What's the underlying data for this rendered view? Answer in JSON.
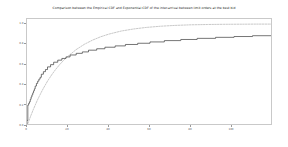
{
  "figure": {
    "background_color": "#ffffff",
    "width": 288,
    "height": 147
  },
  "chart_data": {
    "type": "line",
    "title": "Comparison between the Empirical CDF and Exponential CDF of the inter-arrival between limit orders at the best bid",
    "xlabel": "",
    "ylabel": "",
    "xlim": [
      0,
      120
    ],
    "ylim": [
      0,
      1.05
    ],
    "grid": false,
    "legend_position": "none",
    "xticks": [
      0,
      20,
      40,
      60,
      80,
      100
    ],
    "xtick_labels": [
      "0",
      "20",
      "40",
      "60",
      "80",
      "100"
    ],
    "yticks": [
      0.0,
      0.2,
      0.4,
      0.6,
      0.8,
      1.0
    ],
    "ytick_labels": [
      "0.0",
      "0.2",
      "0.4",
      "0.6",
      "0.8",
      "1.0"
    ],
    "series": [
      {
        "name": "Empirical CDF",
        "style": "step",
        "color": "#3b3b3b",
        "linewidth": 0.7,
        "x": [
          0.0,
          0.4,
          0.8,
          1.2,
          1.6,
          2.0,
          2.4,
          2.8,
          3.2,
          3.6,
          4.0,
          4.6,
          5.2,
          5.8,
          6.4,
          7.0,
          8.0,
          9.0,
          10.0,
          11.5,
          13.0,
          15.0,
          17.0,
          19.0,
          21.0,
          24.0,
          27.0,
          30.0,
          34.0,
          38.0,
          43.0,
          48.0,
          54.0,
          60.0,
          67.0,
          75.0,
          83.0,
          92.0,
          101.0,
          110.0,
          120.0
        ],
        "y": [
          0.0,
          0.055,
          0.205,
          0.222,
          0.238,
          0.262,
          0.285,
          0.305,
          0.325,
          0.345,
          0.365,
          0.392,
          0.418,
          0.44,
          0.46,
          0.478,
          0.508,
          0.533,
          0.554,
          0.58,
          0.602,
          0.626,
          0.646,
          0.663,
          0.678,
          0.697,
          0.713,
          0.727,
          0.744,
          0.758,
          0.773,
          0.786,
          0.8,
          0.812,
          0.825,
          0.838,
          0.849,
          0.86,
          0.87,
          0.878,
          0.886
        ]
      },
      {
        "name": "Exponential CDF",
        "style": "dashed",
        "color": "#b0b0b0",
        "linewidth": 0.7,
        "x": [
          0.0,
          1.0,
          2.0,
          3.0,
          4.0,
          5.0,
          6.0,
          7.0,
          8.0,
          10.0,
          12.0,
          14.0,
          16.0,
          18.0,
          20.0,
          24.0,
          28.0,
          32.0,
          36.0,
          40.0,
          46.0,
          52.0,
          58.0,
          65.0,
          72.0,
          80.0,
          88.0,
          96.0,
          105.0,
          112.0,
          120.0
        ],
        "y": [
          0.0,
          0.055,
          0.108,
          0.158,
          0.205,
          0.25,
          0.292,
          0.332,
          0.37,
          0.44,
          0.501,
          0.556,
          0.604,
          0.647,
          0.685,
          0.75,
          0.802,
          0.843,
          0.876,
          0.902,
          0.932,
          0.952,
          0.967,
          0.979,
          0.987,
          0.993,
          0.996,
          0.998,
          0.999,
          1.0,
          1.0
        ]
      }
    ]
  }
}
